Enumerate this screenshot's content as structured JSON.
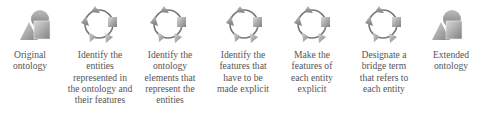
{
  "diagram": {
    "type": "process-flow",
    "steps": [
      {
        "id": "original",
        "icon": "shape-cluster-icon",
        "label": "Original\nontology"
      },
      {
        "id": "step1",
        "icon": "cycle-icon",
        "label": "Identify the\nentities\nrepresented in\nthe ontology and\ntheir features"
      },
      {
        "id": "step2",
        "icon": "cycle-icon",
        "label": "Identify the\nontology\nelements that\nrepresent the\nentities"
      },
      {
        "id": "step3",
        "icon": "cycle-icon",
        "label": "Identify the\nfeatures that\nhave to be\nmade explicit"
      },
      {
        "id": "step4",
        "icon": "cycle-icon",
        "label": "Make the\nfeatures of\neach entity\nexplicit"
      },
      {
        "id": "step5",
        "icon": "cycle-icon",
        "label": "Designate a\nbridge term\nthat refers to\neach entity"
      },
      {
        "id": "extended",
        "icon": "shape-cluster-icon",
        "label": "Extended\nontology"
      }
    ],
    "colors": {
      "shape": "#8c8c8c",
      "shape_light": "#c4c4c4",
      "arrow": "#333333",
      "text": "#555555"
    }
  }
}
